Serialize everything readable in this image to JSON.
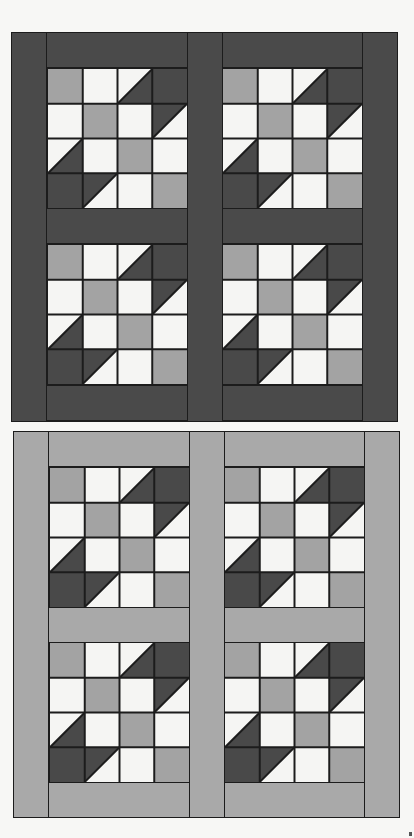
{
  "colors": {
    "dark": "#494949",
    "medium": "#a3a3a3",
    "light": "#f5f5f3",
    "line": "#1c1c1c",
    "sash_dark": "#4a4a4a",
    "sash_light": "#a9a9a9"
  },
  "block_pattern": {
    "grid": "4x4",
    "cells": [
      [
        "medium",
        "tri:light-ul/dark-lr",
        "tri:light-ul/dark-lr",
        "dark"
      ],
      [
        "light",
        "medium",
        "light",
        "tri:dark-ul/light-lr"
      ],
      [
        "tri:light-ul/dark-lr",
        "light",
        "medium",
        "light"
      ],
      [
        "dark",
        "tri:dark-ul/light-lr",
        "light",
        "medium"
      ]
    ],
    "cells_actual": [
      [
        "medium",
        "light",
        "tri:light-ul/dark-lr",
        "dark"
      ],
      [
        "light",
        "medium",
        "light",
        "tri:dark-ul/light-lr"
      ],
      [
        "tri:light-ul/dark-lr",
        "light",
        "medium",
        "light"
      ],
      [
        "dark",
        "tri:dark-ul/light-lr",
        "light",
        "medium"
      ]
    ]
  },
  "quilts": [
    {
      "name": "dark-sashing-version",
      "sashing": "dark",
      "blocks": 4,
      "layout": "2x2"
    },
    {
      "name": "light-sashing-version",
      "sashing": "medium-gray",
      "blocks": 4,
      "layout": "2x2"
    }
  ]
}
